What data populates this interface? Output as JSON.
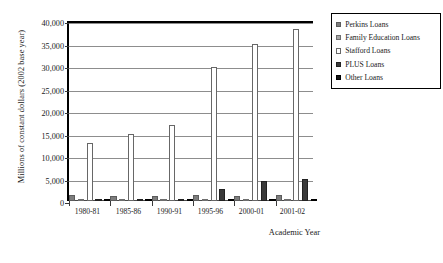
{
  "chart_data": {
    "type": "bar",
    "title": "",
    "subtitle": "",
    "xlabel": "Academic Year",
    "ylabel": "Millions of constant dollars (2002 base year)",
    "categories": [
      "1980-81",
      "1985-86",
      "1990-91",
      "1995-96",
      "2000-01",
      "2001-02"
    ],
    "series": [
      {
        "name": "Perkins Loans",
        "color": "#7d7d7d",
        "values": [
          1350,
          1180,
          1080,
          1250,
          1200,
          1300
        ]
      },
      {
        "name": "Family Education Loans",
        "color": "#a8a8a8",
        "values": [
          180,
          160,
          150,
          180,
          170,
          180
        ]
      },
      {
        "name": "Stafford Loans",
        "color": "#ffffff",
        "values": [
          12900,
          15000,
          17000,
          29800,
          35000,
          38200
        ]
      },
      {
        "name": "PLUS Loans",
        "color": "#3a3a3a",
        "values": [
          170,
          220,
          260,
          2750,
          4350,
          5000
        ]
      },
      {
        "name": "Other Loans",
        "color": "#141414",
        "values": [
          120,
          130,
          140,
          480,
          260,
          300
        ]
      }
    ],
    "ylim": [
      0,
      40000
    ],
    "ytick_values": [
      0,
      5000,
      10000,
      15000,
      20000,
      25000,
      30000,
      35000,
      40000
    ],
    "ytick_labels": [
      "0",
      "5,000",
      "10,000",
      "15,000",
      "20,000",
      "25,000",
      "30,000",
      "35,000",
      "40,000"
    ],
    "grid": "horizontal",
    "legend_position": "right-outside"
  },
  "legend": {
    "items": [
      {
        "label": "Perkins Loans"
      },
      {
        "label": "Family Education Loans"
      },
      {
        "label": "Stafford Loans"
      },
      {
        "label": "PLUS Loans"
      },
      {
        "label": "Other Loans"
      }
    ]
  }
}
